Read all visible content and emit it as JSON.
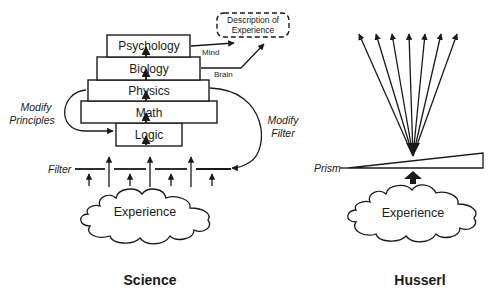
{
  "science": {
    "title": "Science",
    "stack": [
      {
        "label": "Psychology"
      },
      {
        "label": "Biology"
      },
      {
        "label": "Physics"
      },
      {
        "label": "Math"
      },
      {
        "label": "Logic"
      }
    ],
    "description_box": {
      "line1": "Description of",
      "line2": "Experience"
    },
    "mind_label": "Mind",
    "brain_label": "Brain",
    "modify_principles": {
      "line1": "Modify",
      "line2": "Principles"
    },
    "modify_filter": {
      "line1": "Modify",
      "line2": "Filter"
    },
    "filter_label": "Filter",
    "experience_label": "Experience"
  },
  "husserl": {
    "title": "Husserl",
    "prism_label": "Prism",
    "experience_label": "Experience",
    "ray_count": 7
  },
  "colors": {
    "ink": "#1a1a1a",
    "background": "#ffffff"
  }
}
